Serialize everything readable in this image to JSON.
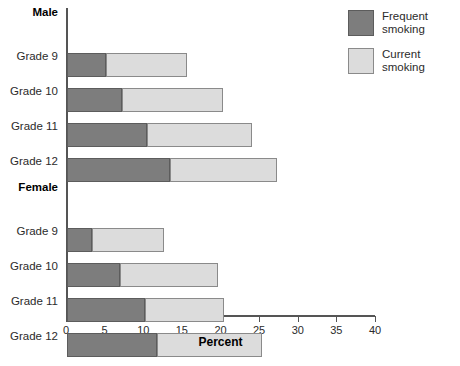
{
  "chart_data": {
    "type": "bar",
    "orientation": "horizontal",
    "stacked": true,
    "title": "",
    "xlabel": "Percent",
    "ylabel": "",
    "xlim": [
      0,
      40
    ],
    "xticks": [
      0,
      5,
      10,
      15,
      20,
      25,
      30,
      35,
      40
    ],
    "xtick_labels": [
      "0",
      "5",
      "10",
      "15",
      "20",
      "25",
      "30",
      "35",
      "40"
    ],
    "grid": false,
    "legend_position": "right-top",
    "groups": [
      {
        "name": "Male",
        "categories": [
          "Grade 9",
          "Grade 10",
          "Grade 11",
          "Grade 12"
        ],
        "frequent": [
          5.1,
          7.1,
          10.4,
          13.3
        ],
        "current": [
          15.5,
          20.2,
          24.0,
          27.2
        ]
      },
      {
        "name": "Female",
        "categories": [
          "Grade 9",
          "Grade 10",
          "Grade 11",
          "Grade 12"
        ],
        "frequent": [
          3.2,
          6.9,
          10.1,
          11.7
        ],
        "current": [
          12.6,
          19.6,
          20.3,
          25.3
        ]
      }
    ],
    "series": [
      {
        "name": "Frequent smoking",
        "color": "#7d7d7d"
      },
      {
        "name": "Current smoking",
        "color": "#dcdcdc"
      }
    ]
  },
  "legend": {
    "items": [
      {
        "label": "Frequent\nsmoking",
        "swatch": "frequent"
      },
      {
        "label": "Current\nsmoking",
        "swatch": "current"
      }
    ]
  },
  "axis": {
    "x_title": "Percent"
  },
  "rows": [
    {
      "kind": "group",
      "label": "Male"
    },
    {
      "kind": "category",
      "label": "Grade 9",
      "frequent": 5.1,
      "total": 15.5
    },
    {
      "kind": "category",
      "label": "Grade 10",
      "frequent": 7.1,
      "total": 20.2
    },
    {
      "kind": "category",
      "label": "Grade 11",
      "frequent": 10.4,
      "total": 24.0
    },
    {
      "kind": "category",
      "label": "Grade 12",
      "frequent": 13.3,
      "total": 27.2
    },
    {
      "kind": "group",
      "label": "Female"
    },
    {
      "kind": "category",
      "label": "Grade 9",
      "frequent": 3.2,
      "total": 12.6
    },
    {
      "kind": "category",
      "label": "Grade 10",
      "frequent": 6.9,
      "total": 19.6
    },
    {
      "kind": "category",
      "label": "Grade 11",
      "frequent": 10.1,
      "total": 20.3
    },
    {
      "kind": "category",
      "label": "Grade 12",
      "frequent": 11.7,
      "total": 25.3
    }
  ],
  "colors": {
    "frequent": "#7d7d7d",
    "current": "#dcdcdc",
    "axis": "#555555",
    "text": "#2b2b2b"
  }
}
